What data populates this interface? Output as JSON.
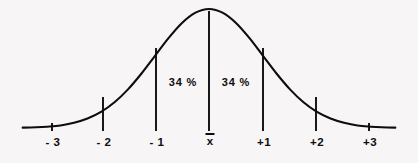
{
  "figure": {
    "background_color": "#f7f5f6",
    "stroke_color": "#0d0d0d",
    "width": 418,
    "height": 163
  },
  "chart_data": {
    "type": "line",
    "title": "",
    "subtitle": "",
    "xlabel": "",
    "ylabel": "",
    "grid": false,
    "legend_position": "none",
    "xlim": [
      -3.45,
      3.45
    ],
    "ylim": [
      0,
      1
    ],
    "x": [
      -3.45,
      -3.2,
      -3.0,
      -2.75,
      -2.5,
      -2.25,
      -2.0,
      -1.75,
      -1.5,
      -1.25,
      -1.0,
      -0.75,
      -0.5,
      -0.25,
      0.0,
      0.25,
      0.5,
      0.75,
      1.0,
      1.25,
      1.5,
      1.75,
      2.0,
      2.25,
      2.5,
      2.75,
      3.0,
      3.2,
      3.45
    ],
    "y": [
      0.0028,
      0.0063,
      0.0111,
      0.0208,
      0.0439,
      0.0796,
      0.1353,
      0.2163,
      0.3247,
      0.4578,
      0.6065,
      0.7548,
      0.8825,
      0.9692,
      1.0,
      0.9692,
      0.8825,
      0.7548,
      0.6065,
      0.4578,
      0.3247,
      0.2163,
      0.1353,
      0.0796,
      0.0439,
      0.0208,
      0.0111,
      0.0063,
      0.0028
    ],
    "series": [
      {
        "name": "normal-curve",
        "values": [
          0.0028,
          0.0063,
          0.0111,
          0.0208,
          0.0439,
          0.0796,
          0.1353,
          0.2163,
          0.3247,
          0.4578,
          0.6065,
          0.7548,
          0.8825,
          0.9692,
          1.0,
          0.9692,
          0.8825,
          0.7548,
          0.6065,
          0.4578,
          0.3247,
          0.2163,
          0.1353,
          0.0796,
          0.0439,
          0.0208,
          0.0111,
          0.0063,
          0.0028
        ]
      }
    ],
    "tick_labels": [
      "- 3",
      "- 2",
      "- 1",
      "x̄",
      "+1",
      "+2",
      "+3"
    ],
    "tick_values": [
      -3,
      -2,
      -1,
      0,
      1,
      2,
      3
    ],
    "annotations": [
      {
        "text": "34 %",
        "x": -0.5,
        "y": 0.46
      },
      {
        "text": "34 %",
        "x": 0.5,
        "y": 0.46
      }
    ]
  },
  "axis": {
    "markers": [
      {
        "id": "minus-3",
        "label": "- 3",
        "x_px": 52,
        "line_top_px": 123,
        "line_bottom_px": 131,
        "label_x_px": 53,
        "label_y_px": 137
      },
      {
        "id": "minus-2",
        "label": "- 2",
        "x_px": 103,
        "line_top_px": 97,
        "line_bottom_px": 131,
        "label_x_px": 104,
        "label_y_px": 137
      },
      {
        "id": "minus-1",
        "label": "- 1",
        "x_px": 156,
        "line_top_px": 48,
        "line_bottom_px": 131,
        "label_x_px": 157,
        "label_y_px": 137
      },
      {
        "id": "mean",
        "label": "x̄",
        "x_px": 209,
        "line_top_px": 11,
        "line_bottom_px": 131,
        "label_x_px": 210,
        "label_y_px": 133
      },
      {
        "id": "plus-1",
        "label": "+1",
        "x_px": 263,
        "line_top_px": 48,
        "line_bottom_px": 131,
        "label_x_px": 264,
        "label_y_px": 137
      },
      {
        "id": "plus-2",
        "label": "+2",
        "x_px": 316,
        "line_top_px": 97,
        "line_bottom_px": 131,
        "label_x_px": 317,
        "label_y_px": 137
      },
      {
        "id": "plus-3",
        "label": "+3",
        "x_px": 369,
        "line_top_px": 123,
        "line_bottom_px": 131,
        "label_x_px": 370,
        "label_y_px": 137
      }
    ]
  },
  "percent_labels": [
    {
      "id": "left-34-percent",
      "text": "34 %",
      "x_px": 183,
      "y_px": 77
    },
    {
      "id": "right-34-percent",
      "text": "34 %",
      "x_px": 236,
      "y_px": 77
    }
  ],
  "curve": {
    "path": "M 25,128 C 48,127 62,124 76,117 C 92,109 106,96 120,82 C 134,68 148,50 162,34 C 176,19 192,10 209,9 C 226,10 242,19 256,34 C 270,50 284,68 298,82 C 312,96 326,109 342,117 C 356,124 374,127 397,128",
    "stroke_width": 2.1
  }
}
